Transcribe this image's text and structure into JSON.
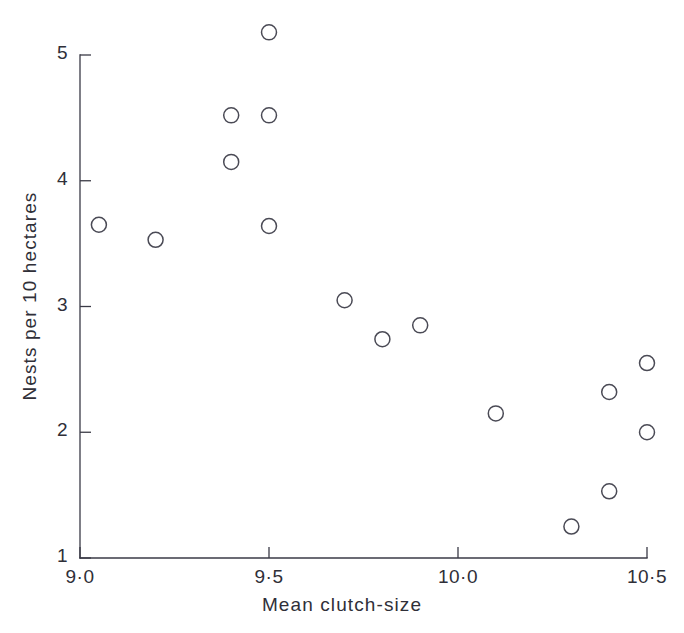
{
  "figure": {
    "background_color": "#ffffff",
    "marker_color": "#4a4a55",
    "axis_color": "#3a3a46",
    "text_color": "#2f2f38"
  },
  "chart_data": {
    "type": "scatter",
    "title": "",
    "xlabel": "Mean clutch-size",
    "ylabel": "Nests per 10 hectares",
    "xlim": [
      9.0,
      10.5
    ],
    "ylim": [
      1,
      5
    ],
    "grid": false,
    "legend": null,
    "marker_style": "open-circle",
    "xtick_labels": [
      "9·0",
      "9·5",
      "10·0",
      "10·5"
    ],
    "xtick_values": [
      9.0,
      9.5,
      10.0,
      10.5
    ],
    "ytick_labels": [
      "1",
      "2",
      "3",
      "4",
      "5"
    ],
    "ytick_values": [
      1,
      2,
      3,
      4,
      5
    ],
    "x": [
      9.05,
      9.2,
      9.4,
      9.4,
      9.5,
      9.5,
      9.5,
      9.7,
      9.8,
      9.9,
      10.1,
      10.3,
      10.4,
      10.4,
      10.5,
      10.5
    ],
    "y": [
      3.65,
      3.53,
      4.52,
      4.15,
      5.18,
      4.52,
      3.64,
      3.05,
      2.74,
      2.85,
      2.15,
      1.25,
      1.53,
      2.32,
      2.55,
      2.0
    ],
    "points": [
      {
        "x": 9.05,
        "y": 3.65
      },
      {
        "x": 9.2,
        "y": 3.53
      },
      {
        "x": 9.4,
        "y": 4.52
      },
      {
        "x": 9.4,
        "y": 4.15
      },
      {
        "x": 9.5,
        "y": 5.18
      },
      {
        "x": 9.5,
        "y": 4.52
      },
      {
        "x": 9.5,
        "y": 3.64
      },
      {
        "x": 9.7,
        "y": 3.05
      },
      {
        "x": 9.8,
        "y": 2.74
      },
      {
        "x": 9.9,
        "y": 2.85
      },
      {
        "x": 10.1,
        "y": 2.15
      },
      {
        "x": 10.3,
        "y": 1.25
      },
      {
        "x": 10.4,
        "y": 1.53
      },
      {
        "x": 10.4,
        "y": 2.32
      },
      {
        "x": 10.5,
        "y": 2.55
      },
      {
        "x": 10.5,
        "y": 2.0
      }
    ]
  }
}
